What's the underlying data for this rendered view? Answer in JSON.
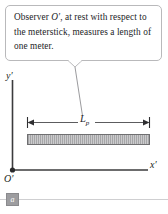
{
  "figure": {
    "panel_label": "a",
    "callout": {
      "line1_prefix": "Observer ",
      "line1_symbol": "O′",
      "line1_suffix": ", at rest with respect",
      "line2": "to the meterstick, measures a",
      "line3": "length of one meter.",
      "full_text": "Observer O′, at rest with respect to the meterstick, measures a length of one meter."
    },
    "axes": {
      "y_label": "y′",
      "x_label": "x′",
      "origin_label": "O′"
    },
    "meterstick": {
      "dimension_label_base": "L",
      "dimension_label_sub": "p",
      "measured_length_text": "one meter"
    },
    "colors": {
      "callout_border": "#b9b9bb",
      "axis": "#3b3b3d",
      "bar_fill": "#a6a6a8",
      "bar_stroke": "#6f6f71",
      "badge_fill": "#9d9da0",
      "rule": "#cfcfd1",
      "text": "#1d1d1f"
    }
  }
}
